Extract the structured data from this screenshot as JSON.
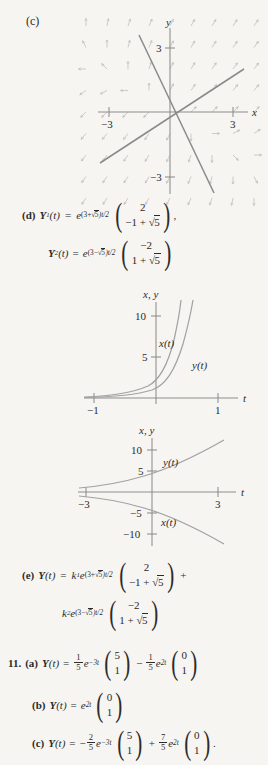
{
  "page": {
    "background": "#f7f5f2",
    "ink": "#2b2b2b"
  },
  "part_c": {
    "label": "(c)",
    "plot": {
      "type": "phase-portrait",
      "xlabel": "x",
      "ylabel": "y",
      "x_ticks": [
        -3,
        3
      ],
      "x_tick_labels": [
        "−3",
        "3"
      ],
      "y_ticks": [
        3,
        -3
      ],
      "y_tick_labels": [
        "3",
        "−3"
      ],
      "xlim": [
        -4.4,
        4.4
      ],
      "ylim": [
        -4.4,
        4.4
      ],
      "straight_line_slopes": [
        0.618,
        -2.618
      ],
      "description": "direction field with two straight-line solutions through the origin"
    }
  },
  "part_d": {
    "label": "(d)",
    "solution_1": {
      "name": "Y",
      "name_sub": "1",
      "arg": "(t)",
      "eq": "=",
      "exp_base": "e",
      "exp_power_pre": "(3+",
      "exp_power_radicand": "5",
      "exp_power_post": ")t/2",
      "vector": [
        "2",
        "−1 + √5"
      ],
      "vector_top": "2",
      "vector_bottom_pre": "−1 + ",
      "vector_bottom_radicand": "5",
      "trailing": ","
    },
    "solution_2": {
      "name": "Y",
      "name_sub": "2",
      "arg": "(t)",
      "eq": "=",
      "exp_base": "e",
      "exp_power_pre": "(3−",
      "exp_power_radicand": "5",
      "exp_power_post": ")t/2",
      "vector_top": "−2",
      "vector_bottom_pre": "1 + ",
      "vector_bottom_radicand": "5",
      "trailing": ""
    }
  },
  "graph_1": {
    "axis_label_y": "x, y",
    "axis_label_t": "t",
    "y_ticks": [
      10,
      5
    ],
    "y_tick_labels": [
      "10",
      "5"
    ],
    "t_ticks": [
      -1,
      1
    ],
    "t_tick_labels": [
      "−1",
      "1"
    ],
    "curve_labels": [
      "x(t)",
      "y(t)"
    ],
    "ylim": [
      0,
      13
    ],
    "tlim": [
      -1.35,
      1.35
    ],
    "type": "line",
    "series": [
      {
        "name": "x(t)",
        "note": "growing exponential, steeper, left of y(t)"
      },
      {
        "name": "y(t)",
        "note": "growing exponential, to the right of x(t)"
      }
    ]
  },
  "graph_2": {
    "axis_label_y": "x, y",
    "axis_label_t": "t",
    "y_ticks": [
      10,
      5,
      -5,
      -10
    ],
    "y_tick_labels": [
      "10",
      "5",
      "−5",
      "−10"
    ],
    "t_ticks": [
      -3,
      3
    ],
    "t_tick_labels": [
      "−3",
      "3"
    ],
    "curve_labels": [
      "y(t)",
      "x(t)"
    ],
    "ylim": [
      -13,
      13
    ],
    "tlim": [
      -3.9,
      3.9
    ],
    "type": "line",
    "series": [
      {
        "name": "y(t)",
        "note": "positive growing exponential above t-axis"
      },
      {
        "name": "x(t)",
        "note": "negative growing exponential below t-axis"
      }
    ]
  },
  "part_e": {
    "label": "(e)",
    "name": "Y",
    "arg": "(t)",
    "eq": "=",
    "term1": {
      "coef": "k",
      "coef_sub": "1",
      "exp_base": "e",
      "exp_power_pre": "(3+",
      "exp_power_radicand": "5",
      "exp_power_post": ")t/2",
      "vector_top": "2",
      "vector_bottom_pre": "−1 + ",
      "vector_bottom_radicand": "5"
    },
    "plus": "+",
    "term2": {
      "coef": "k",
      "coef_sub": "2",
      "exp_base": "e",
      "exp_power_pre": "(3−",
      "exp_power_radicand": "5",
      "exp_power_post": ")t/2",
      "vector_top": "−2",
      "vector_bottom_pre": "1 + ",
      "vector_bottom_radicand": "5"
    }
  },
  "problem_11": {
    "number": "11.",
    "parts": [
      {
        "label": "(a)",
        "name": "Y",
        "arg": "(t)",
        "eq": "=",
        "terms": [
          {
            "sign": "",
            "frac_num": "1",
            "frac_den": "5",
            "exp_base": "e",
            "exp_power": "−3t",
            "vector": [
              "5",
              "1"
            ]
          },
          {
            "sign": "−",
            "frac_num": "1",
            "frac_den": "5",
            "exp_base": "e",
            "exp_power": "2t",
            "vector": [
              "0",
              "1"
            ]
          }
        ],
        "trailing": ""
      },
      {
        "label": "(b)",
        "name": "Y",
        "arg": "(t)",
        "eq": "=",
        "terms": [
          {
            "sign": "",
            "frac_num": "",
            "frac_den": "",
            "exp_base": "e",
            "exp_power": "2t",
            "vector": [
              "0",
              "1"
            ]
          }
        ],
        "trailing": ""
      },
      {
        "label": "(c)",
        "name": "Y",
        "arg": "(t)",
        "eq": "=",
        "terms": [
          {
            "sign": "−",
            "frac_num": "2",
            "frac_den": "5",
            "exp_base": "e",
            "exp_power": "−3t",
            "vector": [
              "5",
              "1"
            ]
          },
          {
            "sign": "+",
            "frac_num": "7",
            "frac_den": "5",
            "exp_base": "e",
            "exp_power": "2t",
            "vector": [
              "0",
              "1"
            ]
          }
        ],
        "trailing": "."
      }
    ]
  }
}
